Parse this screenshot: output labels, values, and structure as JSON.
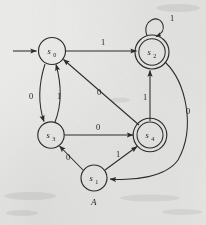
{
  "figure": {
    "type": "finite-state-automaton-diagram",
    "caption": "A",
    "background_color": "#e9e9e7",
    "ink_color": "#2c2c2c"
  },
  "states": [
    {
      "id": "s0",
      "name": "s",
      "subscript": "0",
      "cx": 52,
      "cy": 51,
      "r": 13.5,
      "accepting": false,
      "start": true
    },
    {
      "id": "s2",
      "name": "s",
      "subscript": "2",
      "cx": 152,
      "cy": 52,
      "r": 13.2,
      "accepting": true,
      "start": false
    },
    {
      "id": "s3",
      "name": "s",
      "subscript": "3",
      "cx": 51,
      "cy": 135,
      "r": 13.2,
      "accepting": false,
      "start": false
    },
    {
      "id": "s4",
      "name": "s",
      "subscript": "4",
      "cx": 150,
      "cy": 135,
      "r": 13.2,
      "accepting": true,
      "start": false
    },
    {
      "id": "s1",
      "name": "s",
      "subscript": "1",
      "cx": 94,
      "cy": 178,
      "r": 13.0,
      "accepting": false,
      "start": false
    }
  ],
  "transitions": [
    {
      "from": "s0",
      "to": "s2",
      "label": "1",
      "label_x": 101,
      "label_y": 45
    },
    {
      "from": "s0",
      "to": "s3",
      "label": "0",
      "label_x": 31,
      "label_y": 96
    },
    {
      "from": "s3",
      "to": "s0",
      "label": "1",
      "label_x": 57,
      "label_y": 96
    },
    {
      "from": "s3",
      "to": "s4",
      "label": "0",
      "label_x": 97,
      "label_y": 130
    },
    {
      "from": "s4",
      "to": "s0",
      "label": "0",
      "label_x": 98,
      "label_y": 92
    },
    {
      "from": "s4",
      "to": "s2",
      "label": "1",
      "label_x": 144,
      "label_y": 97
    },
    {
      "from": "s2",
      "to": "s2",
      "label": "1",
      "label_x": 171,
      "label_y": 19
    },
    {
      "from": "s2",
      "to": "s1",
      "label": "0",
      "label_x": 188,
      "label_y": 111
    },
    {
      "from": "s1",
      "to": "s3",
      "label": "0",
      "label_x": 68,
      "label_y": 157
    },
    {
      "from": "s1",
      "to": "s4",
      "label": "1",
      "label_x": 117,
      "label_y": 154
    }
  ],
  "start_marker": {
    "x1": 13,
    "y1": 51,
    "x2": 38,
    "y2": 51
  }
}
